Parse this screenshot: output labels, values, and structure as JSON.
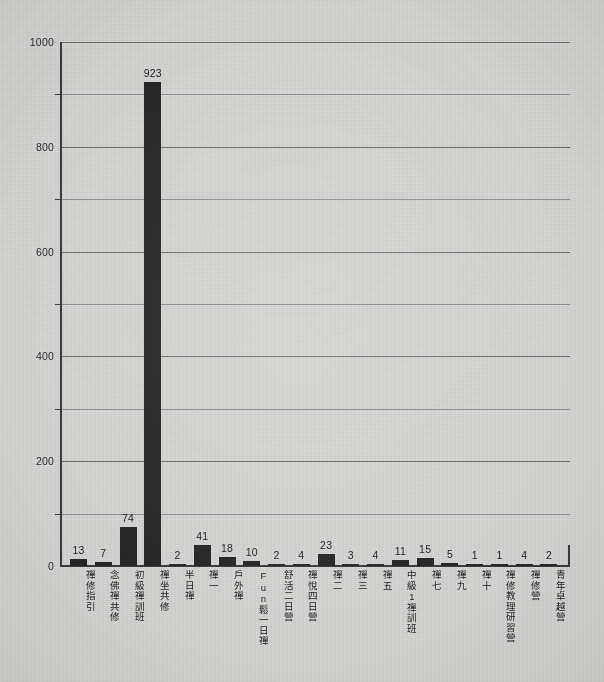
{
  "chart_data": {
    "type": "bar",
    "title": "",
    "subtitle": "",
    "xlabel": "",
    "ylabel": "",
    "ylim": [
      0,
      1000
    ],
    "grid": true,
    "legend": null,
    "y_ticks": [
      0,
      200,
      400,
      600,
      800,
      1000
    ],
    "y_minor_ticks": [
      100,
      300,
      500,
      700,
      900
    ],
    "bar_color": "#262626",
    "background_color": "#d5d5d3",
    "axis_color": "#3b3b3b",
    "gridline_color": "#6e6e6c",
    "categories": [
      "禪修指引",
      "念佛禪共修",
      "初級禪訓班",
      "禪坐共修",
      "半日禪",
      "禪一",
      "戶外禪",
      "Fun鬆一日禪",
      "舒活二日營",
      "禪悅四日營",
      "禪二",
      "禪三",
      "禪五",
      "中級1禪訓班",
      "禪七",
      "禪九",
      "禪十",
      "禪修教理研習營",
      "禪修營",
      "青年卓越營"
    ],
    "values": [
      13,
      7,
      74,
      923,
      2,
      41,
      18,
      10,
      2,
      4,
      23,
      3,
      4,
      11,
      15,
      5,
      1,
      1,
      4,
      2
    ],
    "value_labels": [
      "13",
      "7",
      "74",
      "923",
      "2",
      "41",
      "18",
      "10",
      "2",
      "4",
      "23",
      "3",
      "4",
      "11",
      "15",
      "5",
      "1",
      "1",
      "4",
      "2"
    ],
    "y_tick_labels": [
      "0",
      "200",
      "400",
      "600",
      "800",
      "1000"
    ]
  }
}
